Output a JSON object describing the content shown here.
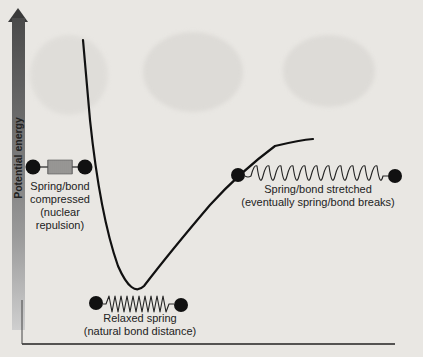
{
  "diagram": {
    "y_axis": {
      "label": "Potential energy",
      "arrow_direction": "up"
    },
    "curve": {
      "type": "morse-like potential well",
      "color": "#111111"
    },
    "annotations": {
      "compressed": {
        "line1": "Spring/bond",
        "line2": "compressed",
        "line3": "(nuclear",
        "line4": "repulsion)",
        "icon": "compressed-spring-icon"
      },
      "relaxed": {
        "line1": "Relaxed spring",
        "line2": "(natural bond distance)",
        "icon": "relaxed-spring-icon"
      },
      "stretched": {
        "line1": "Spring/bond stretched",
        "line2": "(eventually spring/bond breaks)",
        "icon": "stretched-spring-icon"
      }
    },
    "colors": {
      "background": "#e9e7e3",
      "ink": "#222222",
      "axis_gradient_top": "#4a4a4a",
      "axis_gradient_bottom": "#cfcfcf"
    }
  }
}
